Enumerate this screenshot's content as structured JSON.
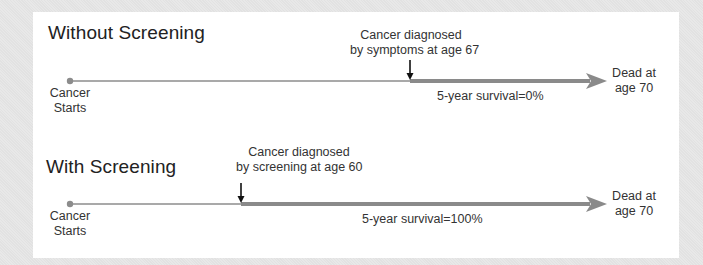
{
  "colors": {
    "background": "#e4e4e4",
    "panel": "#ffffff",
    "thin_line": "#8c8c8c",
    "thick_arrow": "#8a8a8a",
    "marker_arrow": "#111111",
    "text": "#2a2a2a"
  },
  "rows": [
    {
      "title": "Without Screening",
      "start_label_line1": "Cancer",
      "start_label_line2": "Starts",
      "diagnosis_line1": "Cancer diagnosed",
      "diagnosis_line2": "by symptoms at age 67",
      "survival": "5-year survival=0%",
      "end_line1": "Dead at",
      "end_line2": "age 70",
      "diagnosis_age": 67,
      "death_age": 70,
      "survival_pct": 0
    },
    {
      "title": "With Screening",
      "start_label_line1": "Cancer",
      "start_label_line2": "Starts",
      "diagnosis_line1": "Cancer diagnosed",
      "diagnosis_line2": "by screening at age 60",
      "survival": "5-year survival=100%",
      "end_line1": "Dead at",
      "end_line2": "age 70",
      "diagnosis_age": 60,
      "death_age": 70,
      "survival_pct": 100
    }
  ]
}
